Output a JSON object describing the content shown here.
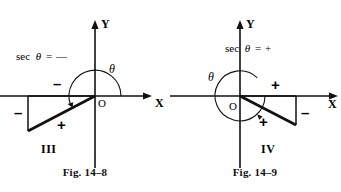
{
  "page": {
    "background_color": "#ffffff",
    "ink_color": "#111111"
  },
  "figures": [
    {
      "id": "fig-14-8",
      "caption": "Fig. 14–8",
      "quadrant_label": "III",
      "formula": {
        "function": "sec",
        "variable": "θ",
        "equals": "=",
        "sign": "—",
        "full_text": "sec θ = —"
      },
      "axis_labels": {
        "x": "X",
        "y": "Y"
      },
      "origin_label": "O",
      "angle_label": "θ",
      "side_signs": {
        "horizontal": "–",
        "vertical": "–",
        "hypotenuse": "+"
      },
      "geometry": {
        "origin": [
          95,
          96
        ],
        "x_axis": [
          0,
          152
        ],
        "y_axis": [
          20,
          168
        ],
        "triangle": [
          [
            95,
            96
          ],
          [
            28,
            96
          ],
          [
            28,
            131
          ]
        ],
        "arc_sweep_degrees": 200,
        "arc_radius": 26
      }
    },
    {
      "id": "fig-14-9",
      "caption": "Fig. 14–9",
      "quadrant_label": "IV",
      "formula": {
        "function": "sec",
        "variable": "θ",
        "equals": "=",
        "sign": "+",
        "full_text": "sec θ = +"
      },
      "axis_labels": {
        "x": "X",
        "y": "Y"
      },
      "origin_label": "O",
      "angle_label": "θ",
      "side_signs": {
        "horizontal": "+",
        "vertical": "–",
        "hypotenuse": "+"
      },
      "geometry": {
        "origin": [
          70,
          96
        ],
        "x_axis": [
          0,
          168
        ],
        "y_axis": [
          20,
          168
        ],
        "triangle": [
          [
            70,
            96
          ],
          [
            126,
            96
          ],
          [
            126,
            125
          ]
        ],
        "arc_sweep_degrees": 333,
        "arc_radius": 25
      }
    }
  ]
}
